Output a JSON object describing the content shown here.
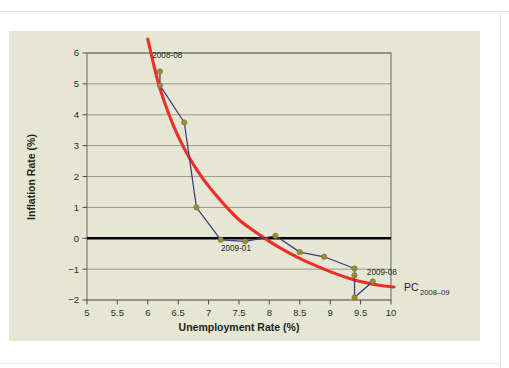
{
  "figure": {
    "background_color": "#e6e7d4",
    "page_color": "#ffffff"
  },
  "chart_data": {
    "type": "scatter",
    "title": "",
    "xlabel": "Unemployment Rate (%)",
    "ylabel": "Inflation Rate (%)",
    "xlim": [
      5,
      10
    ],
    "ylim": [
      -2,
      6
    ],
    "xticks": [
      "5",
      "5.5",
      "6",
      "6.5",
      "7",
      "7.5",
      "8",
      "8.5",
      "9",
      "9.5",
      "10"
    ],
    "xtick_values": [
      5,
      5.5,
      6,
      6.5,
      7,
      7.5,
      8,
      8.5,
      9,
      9.5,
      10
    ],
    "yticks": [
      "6",
      "5",
      "4",
      "3",
      "2",
      "1",
      "0",
      "−1",
      "−2"
    ],
    "ytick_values": [
      6,
      5,
      4,
      3,
      2,
      1,
      0,
      -1,
      -2
    ],
    "grid": "horizontal",
    "legend_position": "inline-annotation",
    "zero_line": 0,
    "series": [
      {
        "name": "Monthly observations 2008-08 to 2009-08",
        "type": "line-marker",
        "line_color": "#3b357a",
        "marker_color": "#9a8b33",
        "x": [
          6.2,
          6.2,
          6.6,
          6.8,
          7.2,
          7.6,
          8.1,
          8.5,
          8.9,
          9.4,
          9.4,
          9.4,
          9.7
        ],
        "y": [
          5.4,
          4.95,
          3.75,
          1.0,
          -0.05,
          -0.1,
          0.08,
          -0.45,
          -0.6,
          -0.98,
          -1.2,
          -1.92,
          -1.4
        ]
      },
      {
        "name": "PC 2008-09 fitted Phillips curve",
        "type": "curve",
        "line_color": "#ee2a23",
        "x": [
          6.0,
          6.1,
          6.2,
          6.35,
          6.5,
          6.7,
          6.9,
          7.1,
          7.3,
          7.5,
          7.7,
          8.0,
          8.3,
          8.6,
          9.0,
          9.4,
          9.8,
          10.05
        ],
        "y": [
          6.45,
          5.6,
          4.85,
          4.0,
          3.3,
          2.55,
          1.95,
          1.45,
          1.0,
          0.6,
          0.3,
          -0.1,
          -0.45,
          -0.75,
          -1.08,
          -1.35,
          -1.52,
          -1.58
        ]
      }
    ],
    "annotations": [
      {
        "name": "2008-08",
        "text": "2008-08",
        "x": 6.32,
        "y": 5.85
      },
      {
        "name": "2009-01",
        "text": "2009-01",
        "x": 7.45,
        "y": -0.42
      },
      {
        "name": "2009-08",
        "text": "2009-08",
        "x": 9.85,
        "y": -1.18
      }
    ],
    "curve_label": {
      "main": "PC",
      "subscript": "2008–09"
    }
  }
}
